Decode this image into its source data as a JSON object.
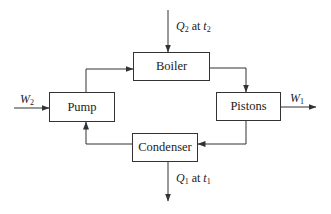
{
  "diagram": {
    "title": "",
    "type": "heat-engine cycle block diagram",
    "nodes": [
      {
        "id": "boiler",
        "label": "Boiler"
      },
      {
        "id": "pistons",
        "label": "Pistons"
      },
      {
        "id": "condenser",
        "label": "Condenser"
      },
      {
        "id": "pump",
        "label": "Pump"
      }
    ],
    "edges": [
      {
        "from": "pump",
        "to": "boiler"
      },
      {
        "from": "boiler",
        "to": "pistons"
      },
      {
        "from": "pistons",
        "to": "condenser"
      },
      {
        "from": "condenser",
        "to": "pump"
      }
    ],
    "external_flows": {
      "heat_in": {
        "symbol": "Q",
        "sub": "2",
        "at": "at",
        "temp_symbol": "t",
        "temp_sub": "2",
        "target": "boiler"
      },
      "heat_out": {
        "symbol": "Q",
        "sub": "1",
        "at": "at",
        "temp_symbol": "t",
        "temp_sub": "1",
        "source": "condenser"
      },
      "work_in": {
        "symbol": "W",
        "sub": "2",
        "target": "pump"
      },
      "work_out": {
        "symbol": "W",
        "sub": "1",
        "source": "pistons"
      }
    },
    "colors": {
      "line": "#333333",
      "text": "#222222",
      "background": "#ffffff"
    }
  }
}
